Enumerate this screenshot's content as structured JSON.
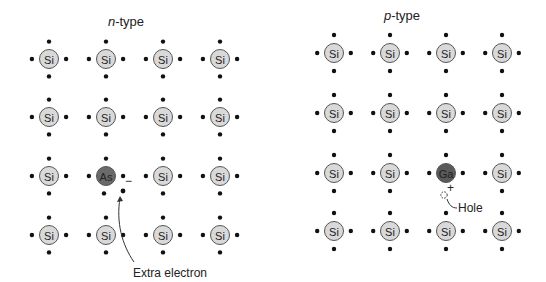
{
  "panels": [
    {
      "id": "n-type",
      "title_italic": "n",
      "title_rest": "-type",
      "title_pos": [
        126,
        26
      ],
      "cols": [
        49,
        106,
        163,
        220
      ],
      "rows": [
        59,
        117,
        176,
        235
      ],
      "dopant": {
        "row": 2,
        "col": 1,
        "symbol": "As",
        "color": "#6a6a6a"
      },
      "annotation": {
        "label": "Extra electron",
        "label_pos": [
          133,
          277
        ],
        "sign": "−"
      },
      "colors": {
        "atom_fill": "#d9d9d9",
        "atom_stroke": "#555555",
        "electron": "#111111"
      }
    },
    {
      "id": "p-type",
      "title_italic": "p",
      "title_rest": "-type",
      "title_pos": [
        402,
        20
      ],
      "cols": [
        334,
        390,
        446,
        502
      ],
      "rows": [
        53,
        113,
        173,
        231
      ],
      "dopant": {
        "row": 2,
        "col": 2,
        "symbol": "Ga",
        "color": "#5a5a5a"
      },
      "annotation": {
        "label": "Hole",
        "label_pos": [
          458,
          213
        ],
        "sign": "+"
      },
      "colors": {
        "atom_fill": "#d9d9d9",
        "atom_stroke": "#555555",
        "electron": "#111111"
      }
    }
  ],
  "host_symbol": "Si",
  "labels": {
    "n_title_italic": "n",
    "n_title_rest": "-type",
    "p_title_italic": "p",
    "p_title_rest": "-type",
    "extra_electron": "Extra electron",
    "hole": "Hole",
    "minus_sign": "−",
    "plus_sign": "+"
  }
}
